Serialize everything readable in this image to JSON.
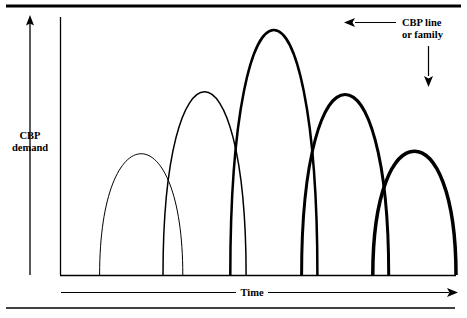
{
  "figure": {
    "background_color": "#ffffff",
    "ink_color": "#000000",
    "top_rule": true,
    "bottom_rule": true
  },
  "axes": {
    "y_axis_label_line1": "CBP",
    "y_axis_label_line2": "demand",
    "y_axis_arrow_direction": "up",
    "x_axis_label": "Time",
    "x_axis_arrow_direction": "right"
  },
  "annotation": {
    "label_line1": "CBP line",
    "label_line2": "or family",
    "left_arrow_direction": "left",
    "down_arrow_direction": "down"
  },
  "chart_data": {
    "type": "line",
    "title": "",
    "subtitle": "",
    "xlabel": "Time",
    "ylabel": "CBP demand",
    "grid": false,
    "legend_position": "none",
    "axis_ticks": false,
    "annotations": [
      {
        "text": "CBP line or family",
        "points_to": "successive generations of overlapping CBP demand curves",
        "position": "top-right"
      }
    ],
    "xlim": [
      0,
      100
    ],
    "ylim": [
      0,
      100
    ],
    "series": [
      {
        "name": "curve-1",
        "order": 1,
        "stroke_width": 1.0,
        "start_x": 10,
        "end_x": 31,
        "peak_x": 20,
        "peak_y": 47
      },
      {
        "name": "curve-2",
        "order": 2,
        "stroke_width": 1.5,
        "start_x": 26,
        "end_x": 47,
        "peak_x": 36,
        "peak_y": 71
      },
      {
        "name": "curve-3",
        "order": 3,
        "stroke_width": 2.5,
        "start_x": 43,
        "end_x": 65,
        "peak_x": 54,
        "peak_y": 95
      },
      {
        "name": "curve-4",
        "order": 4,
        "stroke_width": 3.0,
        "start_x": 61,
        "end_x": 83,
        "peak_x": 72,
        "peak_y": 70
      },
      {
        "name": "curve-5",
        "order": 5,
        "stroke_width": 3.5,
        "start_x": 79,
        "end_x": 100,
        "peak_x": 89,
        "peak_y": 48
      }
    ]
  }
}
